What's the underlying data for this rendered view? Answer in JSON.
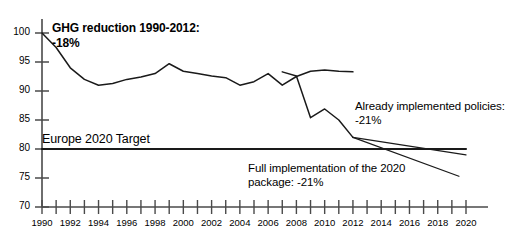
{
  "chart_data": {
    "type": "line",
    "title": "",
    "xlabel": "",
    "ylabel": "",
    "xlim": [
      1990,
      2020
    ],
    "ylim": [
      70,
      100
    ],
    "ytick_values": [
      70,
      75,
      80,
      85,
      90,
      95,
      100
    ],
    "ytick_labels": [
      "70",
      "75",
      "80",
      "85",
      "90",
      "95",
      "100"
    ],
    "xtick_values": [
      1990,
      1991,
      1992,
      1993,
      1994,
      1995,
      1996,
      1997,
      1998,
      1999,
      2000,
      2001,
      2002,
      2003,
      2004,
      2005,
      2006,
      2007,
      2008,
      2009,
      2010,
      2011,
      2012,
      2013,
      2014,
      2015,
      2016,
      2017,
      2018,
      2019,
      2020
    ],
    "xtick_labels_shown": [
      "1990",
      "1992",
      "1994",
      "1996",
      "1998",
      "2000",
      "2002",
      "2004",
      "2006",
      "2008",
      "2010",
      "2012",
      "2014",
      "2016",
      "2018",
      "2020"
    ],
    "grid": false,
    "legend": "none",
    "series": [
      {
        "name": "GHG emissions index (1990=100)",
        "style": "solid-black",
        "x": [
          1990,
          1991,
          1992,
          1993,
          1994,
          1995,
          1996,
          1997,
          1998,
          1999,
          2000,
          2001,
          2002,
          2003,
          2004,
          2005,
          2006,
          2007,
          2008,
          2009,
          2010,
          2011,
          2012
        ],
        "values": [
          100.0,
          97.5,
          94.0,
          92.0,
          91.0,
          91.3,
          92.0,
          92.4,
          93.0,
          94.7,
          93.4,
          93.0,
          92.6,
          92.3,
          91.0,
          91.6,
          93.0,
          91.0,
          92.5,
          93.4,
          93.6,
          93.4,
          93.3
        ]
      },
      {
        "name": "GHG emissions index continued (crisis period)",
        "style": "solid-black",
        "x": [
          2007,
          2008,
          2009,
          2010,
          2011,
          2012
        ],
        "values": [
          93.3,
          92.6,
          85.4,
          86.9,
          85.0,
          82.0
        ]
      },
      {
        "name": "Already implemented policies",
        "style": "solid-thin",
        "x": [
          2012,
          2020
        ],
        "values": [
          82.0,
          79.0
        ]
      },
      {
        "name": "Full implementation of the 2020 package",
        "style": "solid-thin",
        "x": [
          2012,
          2019.5
        ],
        "values": [
          82.0,
          75.3
        ]
      },
      {
        "name": "Europe 2020 Target",
        "style": "solid-bold-horizontal",
        "x": [
          1990,
          2020
        ],
        "values": [
          80.0,
          80.0
        ]
      }
    ],
    "annotations": [
      {
        "id": "ghg-reduction",
        "text": "GHG reduction 1990-2012:\n-18%"
      },
      {
        "id": "europe-target",
        "text": "Europe 2020 Target"
      },
      {
        "id": "already-implemented",
        "text": "Already implemented policies:\n-21%"
      },
      {
        "id": "full-implementation",
        "text": "Full implementation of the 2020\npackage: -21%"
      }
    ],
    "colors": {
      "line": "#1a1a1a",
      "axis": "#4a4a4a",
      "target_line": "#1a1a1a",
      "background": "#ffffff"
    }
  }
}
